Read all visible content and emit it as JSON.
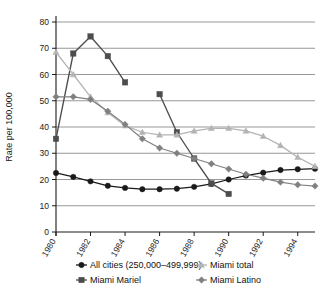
{
  "chart_data": {
    "type": "line",
    "title": "",
    "xlabel": "",
    "ylabel": "Rate per 100,000",
    "xlim": [
      1980,
      1995
    ],
    "ylim": [
      0,
      80
    ],
    "ytick_step": 10,
    "yticks": [
      "0",
      "10",
      "20",
      "30",
      "40",
      "50",
      "60",
      "70",
      "80"
    ],
    "xticks": [
      "1980",
      "1982",
      "1984",
      "1986",
      "1988",
      "1990",
      "1992",
      "1994"
    ],
    "xtick_values": [
      1980,
      1982,
      1984,
      1986,
      1988,
      1990,
      1992,
      1994
    ],
    "grid": "horizontal",
    "legend_position": "bottom",
    "series": [
      {
        "name": "All cities (250,000–499,999)",
        "color": "#1a1a1a",
        "marker": "circle",
        "x": [
          1980,
          1981,
          1982,
          1983,
          1984,
          1985,
          1986,
          1987,
          1988,
          1989,
          1990,
          1991,
          1992,
          1993,
          1994,
          1995
        ],
        "values": [
          22.5,
          21.0,
          19.3,
          17.6,
          16.8,
          16.3,
          16.3,
          16.5,
          17.2,
          18.3,
          20.0,
          21.5,
          22.6,
          23.6,
          23.9,
          24.1
        ]
      },
      {
        "name": "Miami Mariel",
        "color": "#4d4d4d",
        "marker": "square",
        "segments": [
          {
            "x": [
              1980,
              1981,
              1982,
              1983,
              1984
            ],
            "values": [
              35.5,
              68.0,
              74.5,
              67.0,
              57.0
            ]
          },
          {
            "x": [
              1986,
              1987,
              1988,
              1989,
              1990
            ],
            "values": [
              52.5,
              38.0,
              28.0,
              18.5,
              14.5
            ]
          }
        ]
      },
      {
        "name": "Miami total",
        "color": "#b3b3b3",
        "marker": "triangle",
        "x": [
          1980,
          1981,
          1982,
          1983,
          1984,
          1985,
          1986,
          1987,
          1988,
          1989,
          1990,
          1991,
          1992,
          1993,
          1994,
          1995
        ],
        "values": [
          68.5,
          60.0,
          51.5,
          45.5,
          40.5,
          38.0,
          37.0,
          37.0,
          38.5,
          39.5,
          39.5,
          38.5,
          36.5,
          33.0,
          28.5,
          25.0
        ]
      },
      {
        "name": "Miami Latino",
        "color": "#808080",
        "marker": "diamond",
        "x": [
          1980,
          1981,
          1982,
          1983,
          1984,
          1985,
          1986,
          1987,
          1988,
          1989,
          1990,
          1991,
          1992,
          1993,
          1994,
          1995
        ],
        "values": [
          51.5,
          51.5,
          50.5,
          46.0,
          41.0,
          35.5,
          32.0,
          30.0,
          28.0,
          26.0,
          24.0,
          22.0,
          20.5,
          19.0,
          18.0,
          17.5
        ]
      }
    ]
  },
  "legend": {
    "items": [
      {
        "label": "All cities (250,000–499,999)",
        "color": "#1a1a1a",
        "marker": "circle"
      },
      {
        "label": "Miami Mariel",
        "color": "#4d4d4d",
        "marker": "square"
      },
      {
        "label": "Miami total",
        "color": "#b3b3b3",
        "marker": "triangle"
      },
      {
        "label": "Miami Latino",
        "color": "#808080",
        "marker": "diamond"
      }
    ]
  },
  "axis": {
    "y_title": "Rate per 100,000"
  }
}
